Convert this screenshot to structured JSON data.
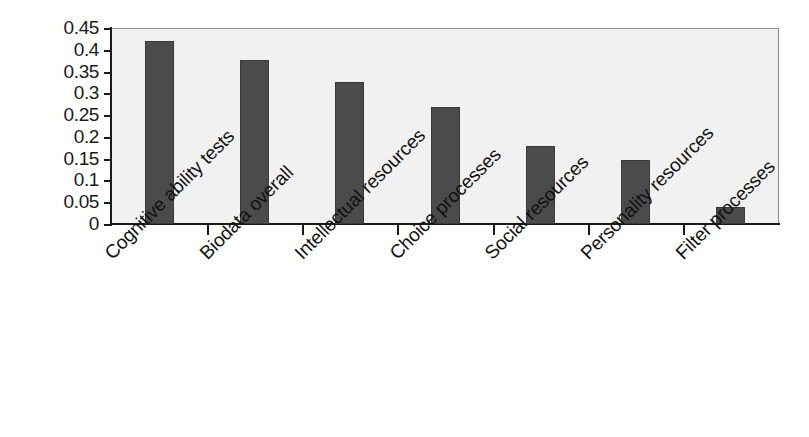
{
  "chart_data": {
    "type": "bar",
    "title": "",
    "subtitle": "",
    "xlabel": "",
    "ylabel": "",
    "categories": [
      "Cognitive ability tests",
      "Biodata overall",
      "Intellectual resources",
      "Choice processes",
      "Social resources",
      "Personality resources",
      "Filter processes"
    ],
    "values": [
      0.42,
      0.377,
      0.325,
      0.268,
      0.178,
      0.148,
      0.04
    ],
    "ylim": [
      0,
      0.45
    ],
    "ytick_labels": [
      "0.45",
      "0.4",
      "0.35",
      "0.3",
      "0.25",
      "0.2",
      "0.15",
      "0.1",
      "0.05",
      "0"
    ],
    "ytick_values": [
      0.45,
      0.4,
      0.35,
      0.3,
      0.25,
      0.2,
      0.15,
      0.1,
      0.05,
      0
    ],
    "grid": false,
    "legend": "none",
    "bar_color": "#4b4b4b",
    "plot_background": "#f1f1f1",
    "axis_color": "#1a1a1a",
    "label_rotation_deg": -45
  }
}
